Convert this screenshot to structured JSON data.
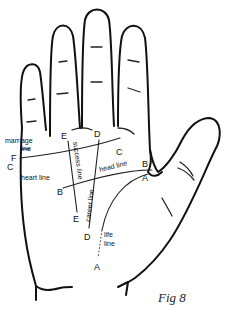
{
  "figure": {
    "caption": "Fig 8"
  },
  "lines": {
    "heart": {
      "label": "heart line",
      "start_marker": "C",
      "end_marker": "C"
    },
    "head": {
      "label": "head line",
      "start_marker": "B",
      "end_marker": "B"
    },
    "life": {
      "label_1": "life",
      "label_2": "line",
      "start_marker": "A",
      "end_marker": "A"
    },
    "career": {
      "label": "career line",
      "start_marker": "D",
      "end_marker": "D"
    },
    "success": {
      "label": "success line",
      "start_marker": "E",
      "end_marker": "E"
    },
    "marriage": {
      "label_1": "marriage",
      "label_2": "line",
      "marker": "F"
    }
  },
  "markers": {
    "F": "F",
    "C_left": "C",
    "C_right": "C",
    "B_left": "B",
    "B_right": "B",
    "A_top": "A",
    "A_bottom": "A",
    "D_top": "D",
    "D_bottom": "D",
    "E_top": "E",
    "E_bottom": "E"
  }
}
